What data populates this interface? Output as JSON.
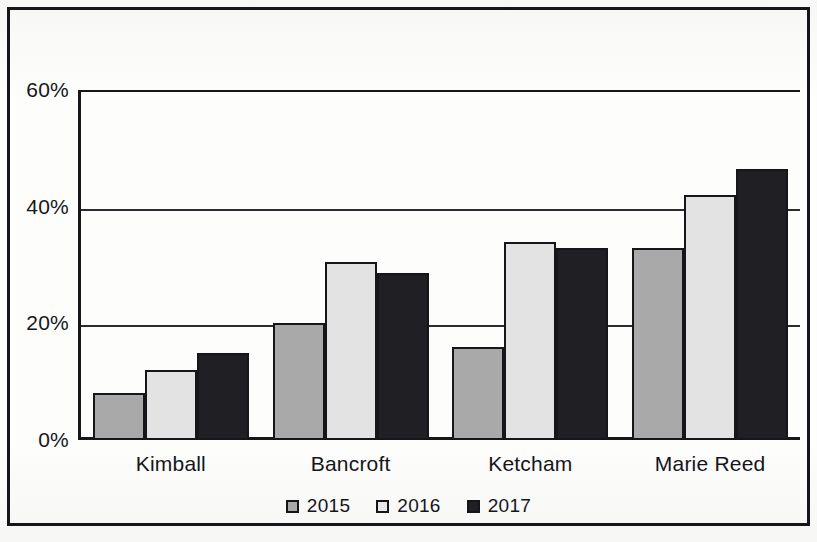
{
  "figure": {
    "background_hint": "scanned book page with faint bleed-through text above the chart",
    "border_color": "#15151a"
  },
  "bleed_through_text": {
    "line1": "",
    "line2": "",
    "line3": "",
    "line4": ""
  },
  "chart_data": {
    "type": "bar",
    "title": "",
    "subtitle": "",
    "xlabel": "",
    "ylabel": "",
    "categories": [
      "Kimball",
      "Bancroft",
      "Ketcham",
      "Marie Reed"
    ],
    "series": [
      {
        "name": "2015",
        "color": "#a9a9a9",
        "values": [
          8,
          20,
          16,
          33
        ]
      },
      {
        "name": "2016",
        "color": "#e3e3e3",
        "values": [
          12,
          30.5,
          34,
          42
        ]
      },
      {
        "name": "2017",
        "color": "#201f23",
        "values": [
          15,
          28.7,
          33,
          46.5
        ]
      }
    ],
    "ylim": [
      0,
      60
    ],
    "yticks": [
      0,
      20,
      40,
      60
    ],
    "ytick_labels": [
      "0%",
      "20%",
      "40%",
      "60%"
    ],
    "grid": "horizontal",
    "legend_position": "bottom-center",
    "value_format": "percent"
  }
}
